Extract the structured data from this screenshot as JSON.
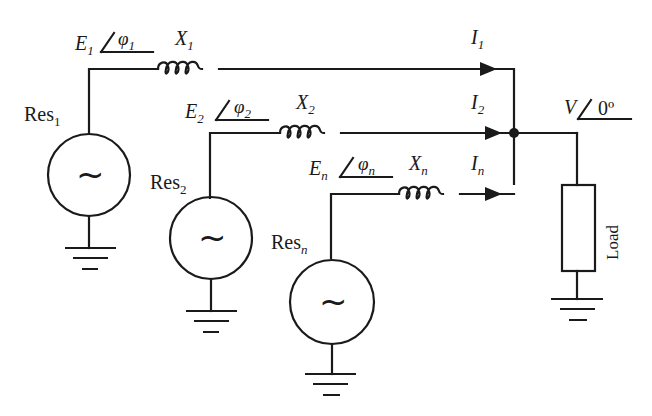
{
  "diagram": {
    "type": "circuit",
    "colors": {
      "stroke": "#1a1a1a",
      "background": "#ffffff"
    },
    "sources": [
      {
        "id": "res1",
        "name": "Res",
        "sub": "1",
        "emf": "E",
        "emf_sub": "1",
        "phase": "φ",
        "phase_sub": "1",
        "reactance": "X",
        "reactance_sub": "1",
        "current": "I",
        "current_sub": "1",
        "symbol": "~"
      },
      {
        "id": "res2",
        "name": "Res",
        "sub": "2",
        "emf": "E",
        "emf_sub": "2",
        "phase": "φ",
        "phase_sub": "2",
        "reactance": "X",
        "reactance_sub": "2",
        "current": "I",
        "current_sub": "2",
        "symbol": "~"
      },
      {
        "id": "resn",
        "name": "Res",
        "sub": "n",
        "emf": "E",
        "emf_sub": "n",
        "phase": "φ",
        "phase_sub": "n",
        "reactance": "X",
        "reactance_sub": "n",
        "current": "I",
        "current_sub": "n",
        "symbol": "~"
      }
    ],
    "bus": {
      "voltage": "V",
      "angle": "0º"
    },
    "load": {
      "label": "Load"
    }
  }
}
